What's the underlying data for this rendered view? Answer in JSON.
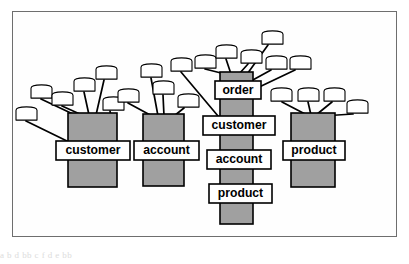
{
  "figure": {
    "frame_color": "#6e6e6e",
    "background": "#ffffff",
    "trunk_fill": "#a0a0a0",
    "trunk_stroke": "#000000",
    "leaf_fill": "#ffffff",
    "leaf_stroke": "#000000",
    "label_fill": "#ffffff",
    "label_stroke": "#000000",
    "label_text_color": "#000000",
    "edge_color": "#000000",
    "caption_artifact": "a                    b      d  bb  c   f      d          e       bb"
  },
  "clusters": [
    {
      "id": "cluster-customer",
      "label": "customer",
      "labels": [
        "customer"
      ],
      "trunk": {
        "x": 56,
        "y": 102,
        "w": 49,
        "h": 74
      },
      "label_boxes": [
        {
          "text": "customer",
          "x": 44,
          "y": 130,
          "w": 74,
          "h": 19
        }
      ],
      "leaf_count": 6,
      "leaves": [
        {
          "x": 18,
          "y": 73,
          "w": 23,
          "h": 15
        },
        {
          "x": 39,
          "y": 80,
          "w": 23,
          "h": 15
        },
        {
          "x": 61,
          "y": 66,
          "w": 23,
          "h": 15
        },
        {
          "x": 83,
          "y": 54,
          "w": 23,
          "h": 15
        },
        {
          "x": 3,
          "y": 95,
          "w": 23,
          "h": 15
        },
        {
          "x": 90,
          "y": 85,
          "w": 23,
          "h": 15
        }
      ]
    },
    {
      "id": "cluster-account",
      "label": "account",
      "labels": [
        "account"
      ],
      "trunk": {
        "x": 131,
        "y": 103,
        "w": 41,
        "h": 72
      },
      "label_boxes": [
        {
          "text": "account",
          "x": 122,
          "y": 130,
          "w": 65,
          "h": 19
        }
      ],
      "leaf_count": 5,
      "leaves": [
        {
          "x": 105,
          "y": 77,
          "w": 23,
          "h": 15
        },
        {
          "x": 128,
          "y": 52,
          "w": 23,
          "h": 15
        },
        {
          "x": 140,
          "y": 69,
          "w": 23,
          "h": 15
        },
        {
          "x": 165,
          "y": 82,
          "w": 23,
          "h": 15
        },
        {
          "x": 158,
          "y": 46,
          "w": 23,
          "h": 15
        }
      ]
    },
    {
      "id": "cluster-order",
      "label": "order",
      "labels": [
        "order",
        "customer",
        "account",
        "product"
      ],
      "trunk": {
        "x": 208,
        "y": 61,
        "w": 33,
        "h": 152
      },
      "label_boxes": [
        {
          "text": "order",
          "x": 203,
          "y": 70,
          "w": 46,
          "h": 18
        },
        {
          "text": "customer",
          "x": 191,
          "y": 105,
          "w": 72,
          "h": 19
        },
        {
          "text": "account",
          "x": 195,
          "y": 139,
          "w": 64,
          "h": 19
        },
        {
          "text": "product",
          "x": 197,
          "y": 173,
          "w": 63,
          "h": 19
        }
      ],
      "leaf_count": 6,
      "leaves": [
        {
          "x": 182,
          "y": 43,
          "w": 23,
          "h": 15
        },
        {
          "x": 203,
          "y": 33,
          "w": 23,
          "h": 15
        },
        {
          "x": 228,
          "y": 38,
          "w": 23,
          "h": 15
        },
        {
          "x": 249,
          "y": 19,
          "w": 23,
          "h": 15
        },
        {
          "x": 253,
          "y": 44,
          "w": 23,
          "h": 15
        },
        {
          "x": 277,
          "y": 44,
          "w": 23,
          "h": 15
        }
      ]
    },
    {
      "id": "cluster-product",
      "label": "product",
      "labels": [
        "product"
      ],
      "trunk": {
        "x": 279,
        "y": 102,
        "w": 44,
        "h": 74
      },
      "label_boxes": [
        {
          "text": "product",
          "x": 271,
          "y": 130,
          "w": 62,
          "h": 19
        }
      ],
      "leaf_count": 4,
      "leaves": [
        {
          "x": 258,
          "y": 76,
          "w": 23,
          "h": 15
        },
        {
          "x": 285,
          "y": 76,
          "w": 23,
          "h": 15
        },
        {
          "x": 311,
          "y": 76,
          "w": 23,
          "h": 15
        },
        {
          "x": 334,
          "y": 88,
          "w": 23,
          "h": 15
        }
      ]
    }
  ],
  "edges": [
    {
      "from": "cluster-customer",
      "leaf": 0,
      "x1": 29,
      "y1": 88,
      "x2": 63,
      "y2": 104
    },
    {
      "from": "cluster-customer",
      "leaf": 1,
      "x1": 50,
      "y1": 95,
      "x2": 70,
      "y2": 104
    },
    {
      "from": "cluster-customer",
      "leaf": 2,
      "x1": 72,
      "y1": 81,
      "x2": 77,
      "y2": 104
    },
    {
      "from": "cluster-customer",
      "leaf": 3,
      "x1": 92,
      "y1": 69,
      "x2": 84,
      "y2": 104
    },
    {
      "from": "cluster-customer",
      "leaf": 4,
      "x1": 14,
      "y1": 110,
      "x2": 57,
      "y2": 131
    },
    {
      "from": "cluster-customer",
      "leaf": 5,
      "x1": 98,
      "y1": 100,
      "x2": 104,
      "y2": 131
    },
    {
      "from": "cluster-account",
      "leaf": 0,
      "x1": 116,
      "y1": 92,
      "x2": 140,
      "y2": 105
    },
    {
      "from": "cluster-account",
      "leaf": 1,
      "x1": 139,
      "y1": 67,
      "x2": 146,
      "y2": 105
    },
    {
      "from": "cluster-account",
      "leaf": 2,
      "x1": 151,
      "y1": 84,
      "x2": 152,
      "y2": 105
    },
    {
      "from": "cluster-account",
      "leaf": 3,
      "x1": 172,
      "y1": 97,
      "x2": 162,
      "y2": 105
    },
    {
      "from": "cluster-account",
      "leaf": 4,
      "x1": 169,
      "y1": 61,
      "x2": 206,
      "y2": 105
    },
    {
      "from": "cluster-order",
      "leaf": 0,
      "x1": 193,
      "y1": 58,
      "x2": 213,
      "y2": 63
    },
    {
      "from": "cluster-order",
      "leaf": 1,
      "x1": 214,
      "y1": 48,
      "x2": 219,
      "y2": 63
    },
    {
      "from": "cluster-order",
      "leaf": 2,
      "x1": 236,
      "y1": 53,
      "x2": 227,
      "y2": 63
    },
    {
      "from": "cluster-order",
      "leaf": 3,
      "x1": 256,
      "y1": 34,
      "x2": 233,
      "y2": 66
    },
    {
      "from": "cluster-order",
      "leaf": 4,
      "x1": 259,
      "y1": 59,
      "x2": 239,
      "y2": 70
    },
    {
      "from": "cluster-order",
      "leaf": 5,
      "x1": 283,
      "y1": 59,
      "x2": 243,
      "y2": 78
    },
    {
      "from": "cluster-product",
      "leaf": 0,
      "x1": 270,
      "y1": 91,
      "x2": 295,
      "y2": 104
    },
    {
      "from": "cluster-product",
      "leaf": 1,
      "x1": 296,
      "y1": 91,
      "x2": 299,
      "y2": 104
    },
    {
      "from": "cluster-product",
      "leaf": 2,
      "x1": 320,
      "y1": 91,
      "x2": 304,
      "y2": 104
    },
    {
      "from": "cluster-product",
      "leaf": 3,
      "x1": 341,
      "y1": 103,
      "x2": 310,
      "y2": 105
    }
  ]
}
